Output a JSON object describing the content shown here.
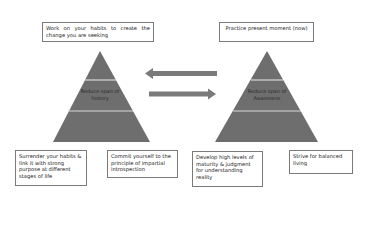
{
  "diagram": {
    "colors": {
      "pyramid_fill": "#6e6e6e",
      "pyramid_divider": "#d8d8d8",
      "arrow_fill": "#7a7a7a",
      "box_border": "#7a7a7a",
      "text": "#222222"
    },
    "top_boxes": [
      {
        "text": "Work on your habits to create the change you are seeking"
      },
      {
        "text": "Practice present moment (now)"
      }
    ],
    "pyramids": [
      {
        "label_line1": "Reduce span of",
        "label_line2": "history"
      },
      {
        "label_line1": "Reduce span of",
        "label_line2": "Awareness"
      }
    ],
    "arrows": [
      {
        "direction": "left",
        "icon": "arrow-left-icon"
      },
      {
        "direction": "right",
        "icon": "arrow-right-icon"
      }
    ],
    "bottom_boxes": [
      {
        "text": "Surrender your habits & link it with strong purpose at different stages of life"
      },
      {
        "text": "Commit yourself to the principle of impartial introspection"
      },
      {
        "text": "Develop high levels of maturity & judgment for understanding reality"
      },
      {
        "text": "Strive for balanced living"
      }
    ]
  }
}
